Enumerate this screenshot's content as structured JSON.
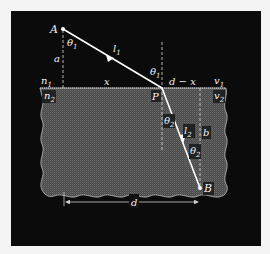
{
  "diagram": {
    "colors": {
      "background": "#0b0b0b",
      "medium2": "#555555",
      "ray": "#ffffff",
      "frame_outer": "#f4f4f4"
    },
    "points": {
      "A": "A",
      "B": "B",
      "P": "P"
    },
    "labels": {
      "theta1_top": "θ",
      "theta1_top_sub": "1",
      "theta1_at_P": "θ",
      "theta1_at_P_sub": "1",
      "theta2_at_P": "θ",
      "theta2_at_P_sub": "2",
      "theta2_lower": "θ",
      "theta2_lower_sub": "2",
      "l1": "l",
      "l1_sub": "1",
      "l2": "l",
      "l2_sub": "2",
      "a": "a",
      "b": "b",
      "x": "x",
      "d_minus_x": "d − x",
      "d": "d",
      "n1": "n",
      "n1_sub": "1",
      "n2": "n",
      "n2_sub": "2",
      "v1": "v",
      "v1_sub": "1",
      "v2": "v",
      "v2_sub": "2"
    }
  }
}
